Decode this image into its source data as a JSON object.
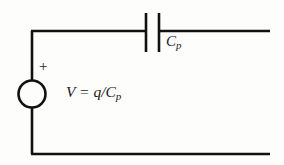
{
  "figure": {
    "background_color": "#fdfdfb",
    "stroke_color": "#111111",
    "width": 284,
    "height": 165
  },
  "source": {
    "symbol": "voltage-source-circle",
    "polarity_marker": "+",
    "label_full": "V = q/Cp",
    "label_variable": "V",
    "label_equals": " = ",
    "label_numerator": "q",
    "label_divider": "/",
    "label_denominator": "C",
    "label_denominator_subscript": "p"
  },
  "capacitor": {
    "symbol": "capacitor-parallel-plates",
    "label_base": "C",
    "label_subscript": "p",
    "label_full": "Cp"
  },
  "wires": {
    "top_rail": "top-conductor",
    "bottom_rail": "bottom-conductor",
    "left_rail": "left-conductor",
    "right_terminals": "open-ended"
  }
}
